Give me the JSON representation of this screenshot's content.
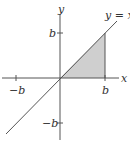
{
  "diagram": {
    "type": "coordinate-plane",
    "axes": {
      "x_label": "x",
      "y_label": "y"
    },
    "ticks": {
      "x_pos": "b",
      "x_neg": "−b",
      "y_pos": "b",
      "y_neg": "−b"
    },
    "line": {
      "label": "y = x"
    },
    "shaded_region": {
      "description": "triangle bounded by y = x, the x-axis, and x = b",
      "vertices": [
        [
          "0",
          "0"
        ],
        [
          "b",
          "0"
        ],
        [
          "b",
          "b"
        ]
      ]
    },
    "colors": {
      "axis": "#555555",
      "line": "#555555",
      "shade": "#cfcfcf",
      "text": "#333333"
    }
  }
}
